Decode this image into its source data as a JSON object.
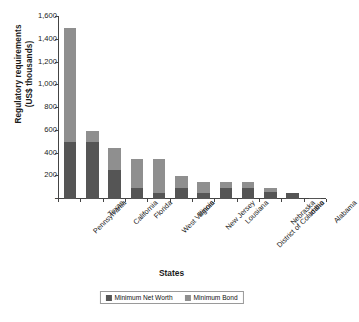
{
  "chart_data": {
    "type": "bar",
    "stacked": true,
    "title": "",
    "xlabel": "States",
    "ylabel": "Regulatory requirements\n(US$ thousands)",
    "ylim": [
      0,
      1600
    ],
    "yticks": [
      "-",
      "200",
      "400",
      "600",
      "800",
      "1,000",
      "1,200",
      "1,400",
      "1,600"
    ],
    "ytick_values": [
      0,
      200,
      400,
      600,
      800,
      1000,
      1200,
      1400,
      1600
    ],
    "grid": false,
    "legend_position": "bottom",
    "categories": [
      "Pennsylvania",
      "Texas",
      "California",
      "Florida",
      "West Virginia",
      "Illinois",
      "New Jersey",
      "Lousiana",
      "District of Columbia",
      "Nebraska",
      "Idaho",
      "Alabama"
    ],
    "series": [
      {
        "name": "Minimum Net Worth",
        "color": "#555555",
        "values": [
          500,
          500,
          255,
          100,
          50,
          100,
          50,
          100,
          100,
          65,
          50,
          10
        ]
      },
      {
        "name": "Minimum Bond",
        "color": "#8f8f8f",
        "values": [
          1000,
          100,
          195,
          250,
          300,
          100,
          100,
          50,
          50,
          35,
          0,
          0
        ]
      }
    ],
    "totals": [
      1500,
      600,
      450,
      350,
      350,
      200,
      150,
      150,
      150,
      100,
      50,
      10
    ]
  },
  "legend": {
    "items": [
      {
        "label": "Minimum Net Worth",
        "color": "#555555",
        "swatch_name": "legend-swatch-net-worth"
      },
      {
        "label": "Minimum Bond",
        "color": "#8f8f8f",
        "swatch_name": "legend-swatch-bond"
      }
    ]
  }
}
